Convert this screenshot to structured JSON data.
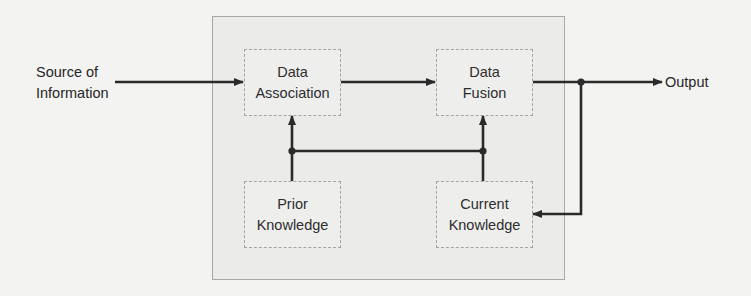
{
  "diagram": {
    "type": "block-flow",
    "input_label": [
      "Source of",
      "Information"
    ],
    "output_label": "Output",
    "container": {
      "name": "fusion-system"
    },
    "nodes": [
      {
        "id": "data_association",
        "lines": [
          "Data",
          "Association"
        ]
      },
      {
        "id": "data_fusion",
        "lines": [
          "Data",
          "Fusion"
        ]
      },
      {
        "id": "prior_knowledge",
        "lines": [
          "Prior",
          "Knowledge"
        ]
      },
      {
        "id": "current_knowledge",
        "lines": [
          "Current",
          "Knowledge"
        ]
      }
    ],
    "edges": [
      {
        "from": "Source of Information",
        "to": "data_association"
      },
      {
        "from": "data_association",
        "to": "data_fusion"
      },
      {
        "from": "data_fusion",
        "to": "Output"
      },
      {
        "from": "data_fusion",
        "to": "current_knowledge",
        "kind": "feedback"
      },
      {
        "from": "prior_knowledge",
        "to": "data_association"
      },
      {
        "from": "prior_knowledge",
        "to": "data_fusion"
      },
      {
        "from": "current_knowledge",
        "to": "data_association"
      },
      {
        "from": "current_knowledge",
        "to": "data_fusion"
      }
    ],
    "colors": {
      "background": "#f3f3f2",
      "container_fill": "#ebebea",
      "box_fill": "#eeeeed",
      "border": "#a6a6a4",
      "line": "#2a2a2a",
      "text": "#2d2d2d"
    }
  }
}
